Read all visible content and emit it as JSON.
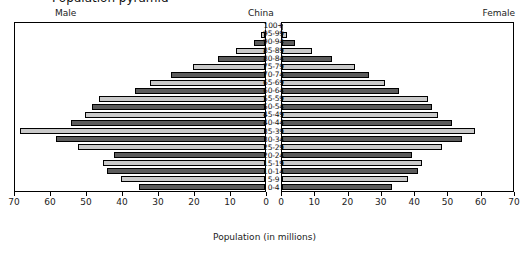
{
  "title": "Population pyramid",
  "header": {
    "male_label": "Male",
    "center_label": "China",
    "female_label": "Female"
  },
  "axis": {
    "xlabel": "Population (in millions)",
    "left_ticks": [
      70,
      60,
      50,
      40,
      30,
      20,
      10,
      0
    ],
    "right_ticks": [
      0,
      10,
      20,
      30,
      40,
      50,
      60,
      70
    ],
    "xlim": [
      0,
      70
    ]
  },
  "colors": {
    "light_bar": "#c9c9c9",
    "dark_bar": "#5c5c5c",
    "outline": "#000000",
    "background": "#ffffff"
  },
  "chart_data": {
    "type": "bar",
    "title": "China",
    "xlabel": "Population (in millions)",
    "ylabel": "",
    "xlim": [
      0,
      70
    ],
    "grid": false,
    "legend": [
      "Male",
      "Female"
    ],
    "legend_position": "top-left and top-right",
    "orientation": "horizontal-back-to-back",
    "categories": [
      "100+",
      "95-99",
      "90-94",
      "85-89",
      "80-84",
      "75-79",
      "70-74",
      "65-69",
      "60-64",
      "55-59",
      "50-54",
      "45-49",
      "40-44",
      "35-39",
      "30-34",
      "25-29",
      "20-24",
      "15-19",
      "10-14",
      "5-9",
      "0-4"
    ],
    "series": [
      {
        "name": "Male",
        "values": [
          0.1,
          1.0,
          3.0,
          8.0,
          13.0,
          20.0,
          26.0,
          32.0,
          36.0,
          46.0,
          48.0,
          50.0,
          54.0,
          68.0,
          58.0,
          52.0,
          42.0,
          45.0,
          44.0,
          40.0,
          35.0
        ]
      },
      {
        "name": "Female",
        "values": [
          0.2,
          1.5,
          4.0,
          9.0,
          15.0,
          22.0,
          26.0,
          31.0,
          35.0,
          44.0,
          45.0,
          47.0,
          51.0,
          58.0,
          54.0,
          48.0,
          39.0,
          42.0,
          41.0,
          38.0,
          33.0
        ]
      }
    ]
  }
}
